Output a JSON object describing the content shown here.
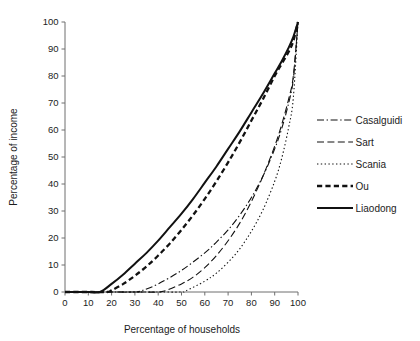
{
  "chart_data": {
    "type": "line",
    "title": "",
    "xlabel": "Percentage of households",
    "ylabel": "Percentage of income",
    "xlim": [
      0,
      100
    ],
    "ylim": [
      0,
      100
    ],
    "xticks": [
      0,
      10,
      20,
      30,
      40,
      50,
      60,
      70,
      80,
      90,
      100
    ],
    "yticks": [
      0,
      10,
      20,
      30,
      40,
      50,
      60,
      70,
      80,
      90,
      100
    ],
    "xtick_labels": [
      "0",
      "10",
      "20",
      "30",
      "40",
      "50",
      "60",
      "70",
      "80",
      "90",
      "100"
    ],
    "ytick_labels": [
      "0",
      "10",
      "20",
      "30",
      "40",
      "50",
      "60",
      "70",
      "80",
      "90",
      "100"
    ],
    "grid": false,
    "legend_position": "right",
    "series": [
      {
        "name": "Casalguidi",
        "style": "dash-dot",
        "stroke_width": 1.1,
        "color": "#111111",
        "x": [
          0,
          10,
          20,
          30,
          33,
          40,
          50,
          60,
          65,
          70,
          75,
          80,
          85,
          90,
          93,
          96,
          98,
          100
        ],
        "y": [
          0,
          0,
          0,
          0,
          0.5,
          3.0,
          8.0,
          14.5,
          18.5,
          23.0,
          28.5,
          35.0,
          43.0,
          53.0,
          60.5,
          70.0,
          79.0,
          100
        ]
      },
      {
        "name": "Sart",
        "style": "dashed",
        "stroke_width": 1.1,
        "color": "#111111",
        "x": [
          0,
          10,
          20,
          30,
          40,
          43,
          50,
          55,
          60,
          65,
          70,
          75,
          80,
          85,
          90,
          93,
          96,
          98,
          100
        ],
        "y": [
          0,
          0,
          0,
          0,
          0,
          0.5,
          3.0,
          5.5,
          9.0,
          13.5,
          19.0,
          25.5,
          33.5,
          43.0,
          54.0,
          62.0,
          71.5,
          80.0,
          100
        ]
      },
      {
        "name": "Scania",
        "style": "dotted",
        "stroke_width": 1.1,
        "color": "#111111",
        "x": [
          0,
          10,
          20,
          30,
          40,
          50,
          52,
          60,
          65,
          70,
          75,
          80,
          85,
          90,
          93,
          96,
          98,
          100
        ],
        "y": [
          0,
          0,
          0,
          0,
          0,
          0,
          0.5,
          4.0,
          7.0,
          11.0,
          16.0,
          22.5,
          30.5,
          41.0,
          49.5,
          61.0,
          72.0,
          100
        ]
      },
      {
        "name": "Ou",
        "style": "thick-dashed",
        "stroke_width": 2.3,
        "color": "#111111",
        "x": [
          0,
          10,
          18,
          20,
          25,
          30,
          35,
          40,
          45,
          50,
          55,
          60,
          65,
          70,
          75,
          80,
          85,
          90,
          93,
          96,
          98,
          100
        ],
        "y": [
          0,
          0,
          0,
          0.6,
          3.0,
          6.0,
          9.5,
          13.5,
          18.0,
          23.0,
          28.5,
          34.5,
          41.0,
          48.0,
          55.5,
          63.5,
          71.5,
          80.0,
          84.5,
          89.0,
          93.0,
          100
        ]
      },
      {
        "name": "Liaodong",
        "style": "solid",
        "stroke_width": 2.0,
        "color": "#111111",
        "x": [
          0,
          5,
          10,
          15,
          20,
          25,
          30,
          35,
          40,
          45,
          50,
          55,
          60,
          65,
          70,
          75,
          80,
          85,
          90,
          93,
          96,
          98,
          100
        ],
        "y": [
          0,
          0,
          0,
          0,
          3.0,
          6.5,
          10.5,
          14.5,
          19.0,
          24.0,
          29.0,
          34.5,
          40.5,
          46.5,
          53.0,
          59.5,
          66.5,
          73.5,
          81.0,
          85.5,
          90.5,
          94.5,
          100
        ]
      }
    ]
  },
  "legend": {
    "items": [
      {
        "label": "Casalguidi"
      },
      {
        "label": "Sart"
      },
      {
        "label": "Scania"
      },
      {
        "label": "Ou"
      },
      {
        "label": "Liaodong"
      }
    ]
  }
}
